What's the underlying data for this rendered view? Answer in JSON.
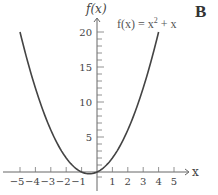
{
  "panel_label": "B",
  "chart_data": {
    "type": "line",
    "title": "",
    "function": "f(x) = x^2 + x",
    "annotation": {
      "prefix": "f(x) = x",
      "exponent": "2",
      "suffix": " + x"
    },
    "xlabel": "x",
    "ylabel": "f(x)",
    "xlim": [
      -5.5,
      5.5
    ],
    "ylim": [
      -1.5,
      21
    ],
    "x_ticks": [
      -5,
      -4,
      -3,
      -2,
      -1,
      1,
      2,
      3,
      4,
      5
    ],
    "x_tick_labels": [
      "−5",
      "−4",
      "−3",
      "−2",
      "−1",
      "1",
      "2",
      "3",
      "4",
      "5"
    ],
    "y_major_ticks": [
      5,
      10,
      15,
      20
    ],
    "y_tick_labels": [
      "5",
      "10",
      "15",
      "20"
    ],
    "y_minor_step": 1,
    "grid": false,
    "series": [
      {
        "name": "f(x) = x^2 + x",
        "x_range": [
          -5,
          4
        ],
        "points": [
          [
            -5,
            20
          ],
          [
            -4.5,
            15.75
          ],
          [
            -4,
            12
          ],
          [
            -3.5,
            8.75
          ],
          [
            -3,
            6
          ],
          [
            -2.5,
            3.75
          ],
          [
            -2,
            2
          ],
          [
            -1.5,
            0.75
          ],
          [
            -1,
            0
          ],
          [
            -0.5,
            -0.25
          ],
          [
            0,
            0
          ],
          [
            0.5,
            0.75
          ],
          [
            1,
            2
          ],
          [
            1.5,
            3.75
          ],
          [
            2,
            6
          ],
          [
            2.5,
            8.75
          ],
          [
            3,
            12
          ],
          [
            3.5,
            15.75
          ],
          [
            4,
            20
          ]
        ]
      }
    ]
  }
}
